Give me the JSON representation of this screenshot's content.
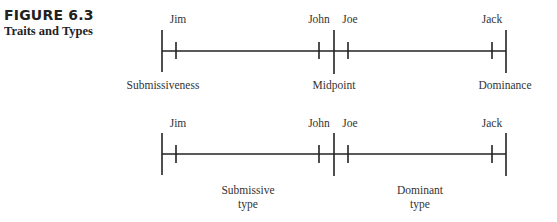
{
  "figure": {
    "label": "FIGURE 6.3",
    "title": "Traits and Types"
  },
  "diagram_top": {
    "people": {
      "jim": "Jim",
      "john": "John",
      "joe": "Joe",
      "jack": "Jack"
    },
    "axis_labels": {
      "left": "Submissiveness",
      "middle": "Midpoint",
      "right": "Dominance"
    }
  },
  "diagram_bottom": {
    "people": {
      "jim": "Jim",
      "john": "John",
      "joe": "Joe",
      "jack": "Jack"
    },
    "region_labels": {
      "left_line1": "Submissive",
      "left_line2": "type",
      "right_line1": "Dominant",
      "right_line2": "type"
    }
  },
  "colors": {
    "line": "#222222",
    "text": "#333333"
  }
}
